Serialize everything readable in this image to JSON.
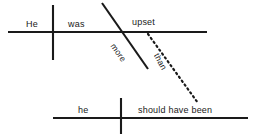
{
  "diagram": {
    "type": "reed-kellogg-sentence-diagram",
    "sentence": "He was upset more than he should have been",
    "colors": {
      "line": "#1a1a1a",
      "text": "#1a1a1a",
      "background": "#ffffff"
    },
    "main_clause": {
      "subject": "He",
      "verb": "was",
      "complement": "upset"
    },
    "modifier": {
      "label": "more"
    },
    "connector": {
      "label": "than",
      "style": "dotted"
    },
    "subordinate_clause": {
      "subject": "he",
      "verb": "should have been"
    },
    "lines": {
      "top_baseline": {
        "x1": 8,
        "y1": 32,
        "x2": 207,
        "y2": 32
      },
      "top_subject_divider": {
        "x1": 53,
        "y1": 5,
        "x2": 53,
        "y2": 60
      },
      "complement_slash": {
        "x1": 102,
        "y1": 3,
        "x2": 148,
        "y2": 69
      },
      "than_connector": {
        "x1": 148,
        "y1": 34,
        "x2": 198,
        "y2": 103
      },
      "bottom_baseline": {
        "x1": 53,
        "y1": 118,
        "x2": 248,
        "y2": 118
      },
      "bottom_subject_divider": {
        "x1": 121,
        "y1": 98,
        "x2": 121,
        "y2": 134
      }
    }
  }
}
